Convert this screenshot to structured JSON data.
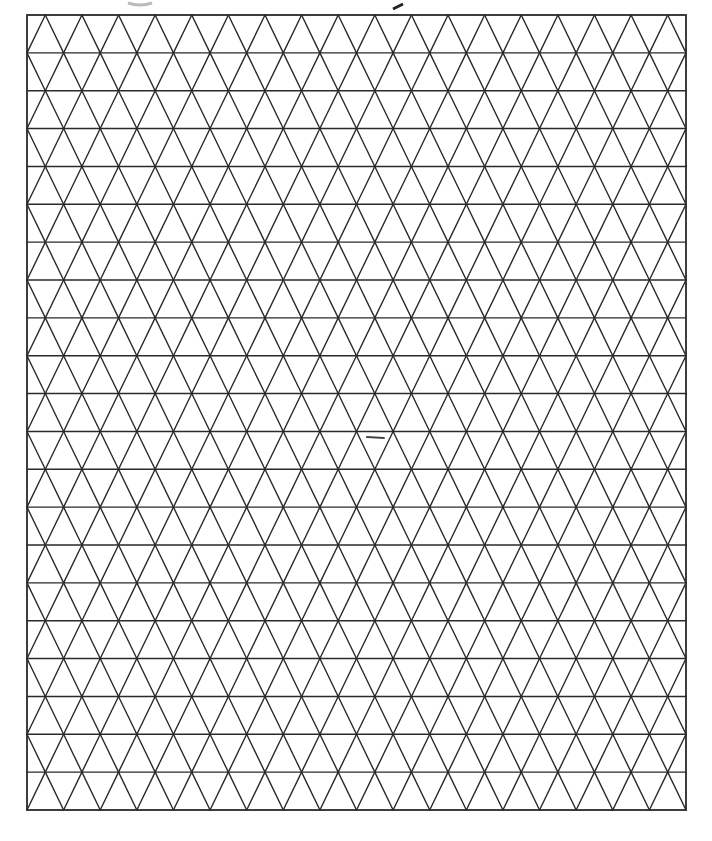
{
  "page": {
    "type": "isometric triangle grid paper",
    "background_color": "#ffffff",
    "line_color": "#2a2a2a"
  },
  "grid": {
    "frame": {
      "left": 27,
      "top": 15,
      "right": 686,
      "bottom": 810
    },
    "rows": 21,
    "columns": 18,
    "row_height": 37.86,
    "triangle_width": 36.61,
    "first_row_apex_on_top": true,
    "line_width": 1.4
  },
  "marks": [
    {
      "name": "stray-pen-dash",
      "x1": 367,
      "y1": 437,
      "x2": 384,
      "y2": 438,
      "color": "#444444"
    }
  ]
}
